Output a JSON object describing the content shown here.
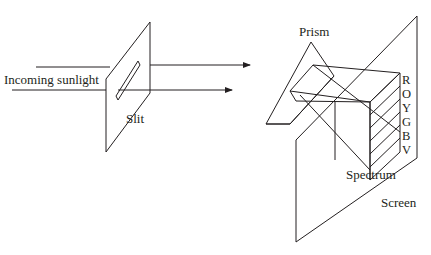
{
  "diagram": {
    "labels": {
      "incoming": "Incoming sunlight",
      "slit": "Slit",
      "prism": "Prism",
      "spectrum": "Spectrum",
      "screen": "Screen"
    },
    "spectrum_colors": [
      "R",
      "O",
      "Y",
      "G",
      "B",
      "V"
    ],
    "line_color": "#231f20",
    "background": "#ffffff"
  }
}
